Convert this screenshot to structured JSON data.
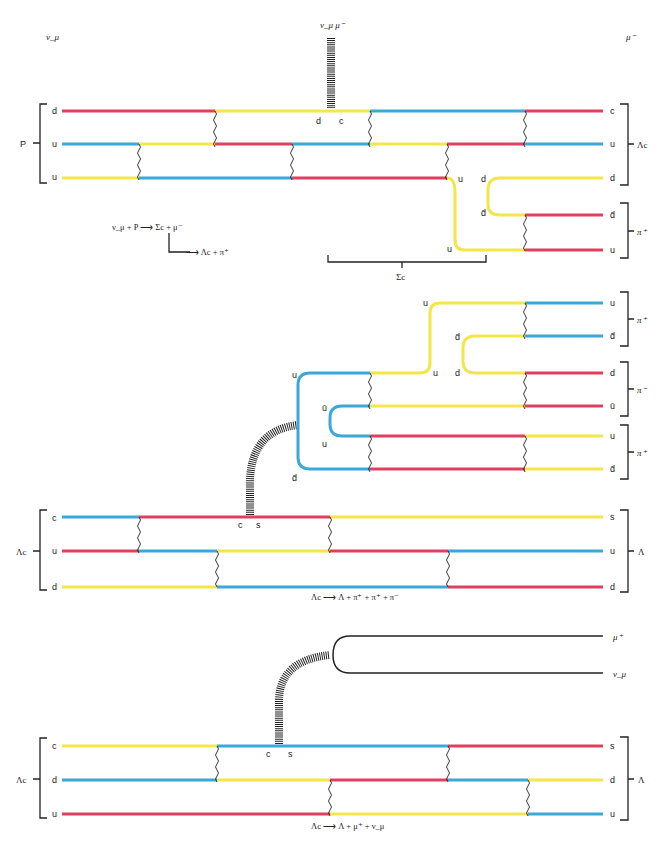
{
  "colors": {
    "red": "#e0405f",
    "blue": "#3aa8d8",
    "yellow": "#f3e64a",
    "ink": "#222222"
  },
  "panel1": {
    "top_left_label": "ν_μ",
    "top_right_label": "μ⁻",
    "w_labels": "ν_μ  μ⁻",
    "proton_label": "P",
    "lambda_c_label": "Λc",
    "pi_plus_label": "π⁺",
    "sigma_c_label": "Σc",
    "left_quarks": [
      "d",
      "u",
      "u"
    ],
    "right_quarks": [
      "c",
      "u",
      "d",
      "d̄",
      "u"
    ],
    "vertex_labels": [
      "d",
      "c"
    ],
    "pair_labels": [
      "u",
      "d",
      "d̄",
      "u"
    ],
    "equation_line1": "ν_μ + P ⟶ Σc + μ⁻",
    "equation_line2": "⟶ Λc + π⁺"
  },
  "panel2": {
    "lambda_c_label": "Λc",
    "lambda_label": "Λ",
    "left_quarks": [
      "c",
      "u",
      "d"
    ],
    "right_quarks": [
      "s",
      "u",
      "d"
    ],
    "vertex_labels": [
      "c",
      "s"
    ],
    "w_branch_labels": [
      "u",
      "ū",
      "u",
      "d̄"
    ],
    "inner_labels": [
      "u",
      "d̄",
      "u",
      "d"
    ],
    "pion_quarks": [
      {
        "top": "u",
        "bottom": "d̄",
        "label": "π⁺"
      },
      {
        "top": "d",
        "bottom": "ū",
        "label": "π⁻"
      },
      {
        "top": "u",
        "bottom": "d̄",
        "label": "π⁺"
      }
    ],
    "equation": "Λc ⟶ Λ + π⁺ + π⁺ + π⁻"
  },
  "panel3": {
    "lambda_c_label": "Λc",
    "lambda_label": "Λ",
    "left_quarks": [
      "c",
      "d",
      "u"
    ],
    "right_quarks": [
      "s",
      "d",
      "u"
    ],
    "vertex_labels": [
      "c",
      "s"
    ],
    "lepton_labels": [
      "μ⁺",
      "ν_μ"
    ],
    "equation": "Λc ⟶ Λ + μ⁺ + ν_μ"
  }
}
